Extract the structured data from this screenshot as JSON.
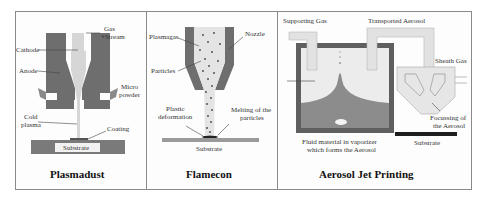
{
  "panels": [
    {
      "title": "Plasmadust",
      "labels": {
        "gas_stream_1": "Gas",
        "gas_stream_2": "+Stream",
        "cathode": "Cathode",
        "anode": "Anode",
        "micro_powder_1": "Micro",
        "micro_powder_2": "powder",
        "cold_plasma_1": "Cold",
        "cold_plasma_2": "plasma",
        "coating": "Coating",
        "substrate": "Substrate"
      }
    },
    {
      "title": "Flamecon",
      "labels": {
        "plasmagas": "Plasmagas",
        "nozzle": "Nozzle",
        "particles": "Particles",
        "plastic_deformation_1": "Plastic",
        "plastic_deformation_2": "deformation",
        "melting_1": "Melting of the",
        "melting_2": "particles",
        "substrate": "Substrate"
      }
    },
    {
      "title": "Aerosol Jet Printing",
      "labels": {
        "supporting_gas": "Supporting Gas",
        "transported_aerosol": "Transported Aerosol",
        "sheath_gas": "Sheath Gas",
        "fluid_material_1": "Fluid material in vaporizer",
        "fluid_material_2": "which forms the Aerosol",
        "focussing_1": "Focussing of",
        "focussing_2": "the Aerosol",
        "substrate": "Substrate"
      }
    }
  ],
  "colors": {
    "dark_metal": "#6e6e6e",
    "light_plasma": "#d6d6d6",
    "substrate": "#7a7a7a",
    "frame": "#8a8a8a",
    "substrate_black": "#1e1e1e"
  }
}
